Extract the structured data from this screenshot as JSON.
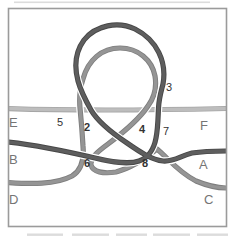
{
  "figure": {
    "type": "knot-tying-diagram",
    "background": "#ffffff",
    "frame_color": "#9b9b9b",
    "artifact_color": "#dcdcdc",
    "label_color": "#757575",
    "number_color": "#333333",
    "ropes": {
      "light": {
        "label": "light-rope-E-F",
        "color": "#bdbdbd",
        "edge": "#a5a5a5"
      },
      "medium": {
        "label": "medium-rope-D-C",
        "color": "#959595",
        "edge": "#7e7e7e"
      },
      "dark": {
        "label": "dark-rope-B-A",
        "color": "#5e5e5e",
        "edge": "#474747"
      }
    },
    "end_labels": {
      "E": "E",
      "F": "F",
      "B": "B",
      "A": "A",
      "D": "D",
      "C": "C"
    },
    "crossing_numbers": {
      "n2": "2",
      "n3": "3",
      "n4": "4",
      "n5": "5",
      "n6": "6",
      "n7": "7",
      "n8": "8"
    }
  }
}
